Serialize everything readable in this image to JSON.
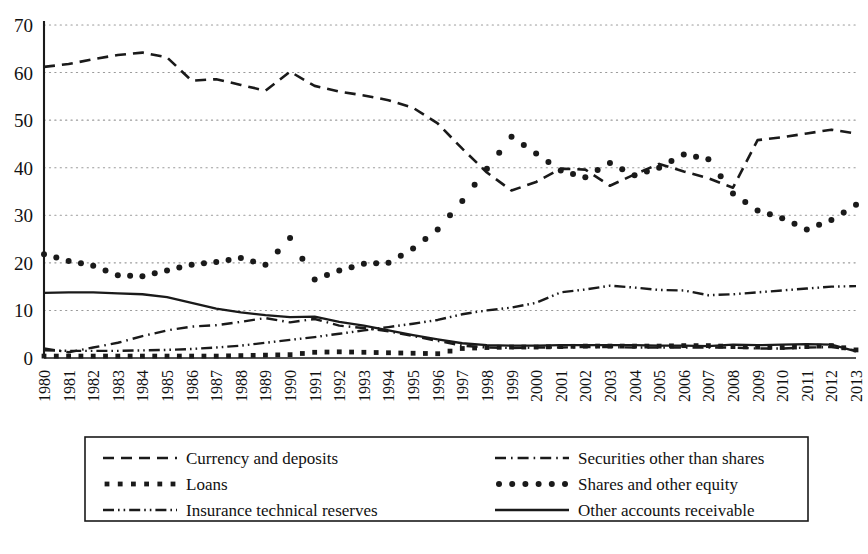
{
  "chart_data": {
    "type": "line",
    "title": "",
    "subtitle": "",
    "xlabel": "",
    "ylabel": "",
    "xlim": [
      1980,
      2013
    ],
    "ylim": [
      0,
      70
    ],
    "yticks": [
      0,
      10,
      20,
      30,
      40,
      50,
      60,
      70
    ],
    "grid": "horizontal-dotted",
    "legend_position": "bottom",
    "legend_columns": 2,
    "categories": [
      "1980",
      "1981",
      "1982",
      "1983",
      "1984",
      "1985",
      "1986",
      "1987",
      "1988",
      "1989",
      "1990",
      "1991",
      "1992",
      "1993",
      "1994",
      "1995",
      "1996",
      "1997",
      "1998",
      "1999",
      "2000",
      "2001",
      "2002",
      "2003",
      "2004",
      "2005",
      "2006",
      "2007",
      "2008",
      "2009",
      "2010",
      "2011",
      "2012",
      "2013"
    ],
    "series": [
      {
        "name": "Currency and deposits",
        "style": "dashed",
        "values": [
          61.2,
          61.8,
          62.8,
          63.7,
          64.2,
          63.2,
          58.3,
          58.6,
          57.4,
          56.2,
          60.2,
          57.2,
          56.0,
          55.2,
          54.2,
          52.6,
          49.3,
          44.0,
          39.0,
          35.2,
          37.0,
          39.8,
          39.6,
          36.2,
          38.6,
          40.8,
          39.2,
          37.8,
          35.8,
          45.8,
          46.4,
          47.2,
          48.0,
          47.2
        ]
      },
      {
        "name": "Loans",
        "style": "dotted-square",
        "values": [
          0.4,
          0.4,
          0.4,
          0.4,
          0.4,
          0.4,
          0.4,
          0.4,
          0.5,
          0.6,
          0.7,
          1.2,
          1.3,
          1.2,
          1.1,
          1.0,
          0.9,
          2.0,
          2.2,
          2.3,
          2.3,
          2.4,
          2.5,
          2.5,
          2.5,
          2.5,
          2.6,
          2.6,
          2.4,
          2.3,
          2.2,
          2.4,
          2.6,
          1.7
        ]
      },
      {
        "name": "Insurance technical reserves",
        "style": "dash-dot-dot",
        "values": [
          1.6,
          1.5,
          1.5,
          1.5,
          1.6,
          1.7,
          1.9,
          2.2,
          2.6,
          3.2,
          3.8,
          4.4,
          5.1,
          5.8,
          6.5,
          7.2,
          8.0,
          9.2,
          10.0,
          10.6,
          11.6,
          13.8,
          14.4,
          15.2,
          14.8,
          14.3,
          14.2,
          13.2,
          13.4,
          13.8,
          14.2,
          14.6,
          15.0,
          15.1
        ]
      },
      {
        "name": "Securities other than shares",
        "style": "dash-dot",
        "values": [
          2.0,
          1.2,
          2.2,
          3.2,
          4.6,
          5.8,
          6.6,
          6.9,
          7.6,
          8.4,
          7.5,
          8.2,
          6.8,
          6.3,
          5.6,
          4.6,
          3.6,
          2.6,
          2.2,
          2.1,
          2.2,
          2.2,
          2.3,
          2.3,
          2.2,
          2.2,
          2.2,
          2.2,
          2.2,
          2.0,
          2.0,
          2.2,
          2.3,
          1.6
        ]
      },
      {
        "name": "Shares and other equity",
        "style": "dotted-round",
        "values": [
          21.8,
          20.4,
          19.4,
          17.4,
          17.2,
          18.4,
          19.6,
          20.2,
          21.0,
          19.6,
          25.2,
          16.5,
          18.4,
          19.8,
          20.0,
          23.0,
          27.0,
          33.0,
          39.8,
          46.5,
          43.0,
          39.4,
          38.0,
          41.0,
          38.4,
          40.0,
          42.8,
          41.8,
          34.6,
          31.0,
          29.4,
          27.0,
          29.0,
          32.2
        ]
      },
      {
        "name": "Other accounts receivable",
        "style": "solid",
        "values": [
          13.7,
          13.8,
          13.8,
          13.6,
          13.4,
          12.8,
          11.6,
          10.4,
          9.6,
          9.0,
          8.6,
          8.7,
          7.6,
          6.8,
          5.8,
          4.8,
          3.9,
          3.1,
          2.7,
          2.6,
          2.6,
          2.7,
          2.7,
          2.7,
          2.7,
          2.6,
          2.6,
          2.5,
          2.8,
          2.7,
          2.8,
          2.9,
          2.8,
          1.4
        ]
      }
    ]
  },
  "legend": {
    "entries": [
      {
        "label": "Currency and deposits"
      },
      {
        "label": "Securities other than shares"
      },
      {
        "label": "Loans"
      },
      {
        "label": "Shares and other equity"
      },
      {
        "label": "Insurance technical reserves"
      },
      {
        "label": "Other accounts receivable"
      }
    ]
  },
  "colors": {
    "line": "#1a1a1a",
    "grid": "#9a9a9a",
    "axis": "#1a1a1a",
    "background": "#ffffff"
  }
}
